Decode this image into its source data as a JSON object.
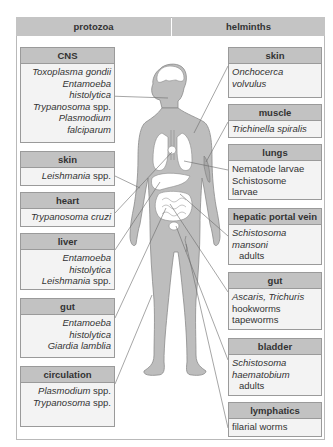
{
  "header": {
    "left": "protozoa",
    "right": "helminths"
  },
  "protozoa": [
    {
      "site": "CNS",
      "organisms": [
        [
          {
            "t": "Toxoplasma gondii",
            "i": true
          }
        ],
        [
          {
            "t": "Entamoeba",
            "i": true
          }
        ],
        [
          {
            "t": "histolytica",
            "i": true
          }
        ],
        [
          {
            "t": "Trypanosoma",
            "i": true
          },
          {
            "t": " spp.",
            "i": false
          }
        ],
        [
          {
            "t": "Plasmodium",
            "i": true
          }
        ],
        [
          {
            "t": "falciparum",
            "i": true
          }
        ]
      ]
    },
    {
      "site": "skin",
      "organisms": [
        [
          {
            "t": "Leishmania",
            "i": true
          },
          {
            "t": " spp.",
            "i": false
          }
        ]
      ]
    },
    {
      "site": "heart",
      "organisms": [
        [
          {
            "t": "Trypanosoma cruzi",
            "i": true
          }
        ]
      ]
    },
    {
      "site": "liver",
      "organisms": [
        [
          {
            "t": "Entamoeba",
            "i": true
          }
        ],
        [
          {
            "t": "histolytica",
            "i": true
          }
        ],
        [
          {
            "t": "Leishmania",
            "i": true
          },
          {
            "t": " spp.",
            "i": false
          }
        ]
      ]
    },
    {
      "site": "gut",
      "organisms": [
        [
          {
            "t": "Entamoeba",
            "i": true
          }
        ],
        [
          {
            "t": "histolytica",
            "i": true
          }
        ],
        [
          {
            "t": "Giardia lamblia",
            "i": true
          }
        ]
      ]
    },
    {
      "site": "circulation",
      "organisms": [
        [
          {
            "t": "Plasmodium",
            "i": true
          },
          {
            "t": " spp.",
            "i": false
          }
        ],
        [
          {
            "t": "Trypanosoma",
            "i": true
          },
          {
            "t": " spp.",
            "i": false
          }
        ]
      ]
    }
  ],
  "helminths": [
    {
      "site": "skin",
      "organisms": [
        [
          {
            "t": "Onchocerca",
            "i": true
          }
        ],
        [
          {
            "t": "volvulus",
            "i": true
          }
        ]
      ]
    },
    {
      "site": "muscle",
      "organisms": [
        [
          {
            "t": "Trichinella spiralis",
            "i": true
          }
        ]
      ]
    },
    {
      "site": "lungs",
      "organisms": [
        [
          {
            "t": "Nematode larvae",
            "i": false
          }
        ],
        [
          {
            "t": "Schistosome",
            "i": false
          }
        ],
        [
          {
            "t": "larvae",
            "i": false
          }
        ]
      ]
    },
    {
      "site": "hepatic portal vein",
      "organisms": [
        [
          {
            "t": "Schistosoma",
            "i": true
          }
        ],
        [
          {
            "t": "mansoni",
            "i": true
          }
        ],
        [
          {
            "t": "adults",
            "i": false,
            "indent": true
          }
        ]
      ]
    },
    {
      "site": "gut",
      "organisms": [
        [
          {
            "t": "Ascaris, Trichuris",
            "i": true
          }
        ],
        [
          {
            "t": "hookworms",
            "i": false
          }
        ],
        [
          {
            "t": "tapeworms",
            "i": false
          }
        ]
      ]
    },
    {
      "site": "bladder",
      "organisms": [
        [
          {
            "t": "Schistosoma",
            "i": true
          }
        ],
        [
          {
            "t": "haematobium",
            "i": true
          }
        ],
        [
          {
            "t": "adults",
            "i": false,
            "indent": true
          }
        ]
      ]
    },
    {
      "site": "lymphatics",
      "organisms": [
        [
          {
            "t": "filarial worms",
            "i": false
          }
        ]
      ]
    }
  ],
  "colors": {
    "header_fill": "#c4c4c4",
    "box_fill": "#f3f3f3",
    "body_fill": "#bdbdbd",
    "organ_fill": "#ffffff"
  }
}
